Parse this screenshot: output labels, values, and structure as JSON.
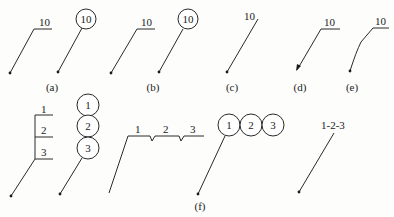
{
  "figure": {
    "row1": {
      "a": {
        "caption": "(a)",
        "underline_label": "10",
        "circle_label": "10"
      },
      "b": {
        "caption": "(b)",
        "underline_label": "10",
        "circle_label": "10"
      },
      "c": {
        "caption": "(c)",
        "label": "10"
      },
      "d": {
        "caption": "(d)",
        "label": "10"
      },
      "e": {
        "caption": "(e)",
        "label": "10"
      }
    },
    "row2": {
      "f": {
        "caption": "(f)",
        "stacked_underline_labels": [
          "1",
          "2",
          "3"
        ],
        "stacked_circle_labels": [
          "1",
          "2",
          "3"
        ],
        "horizontal_underline_labels": [
          "1",
          "2",
          "3"
        ],
        "horizontal_circle_labels": [
          "1",
          "2",
          "3"
        ],
        "inline_label": "1-2-3"
      }
    }
  }
}
